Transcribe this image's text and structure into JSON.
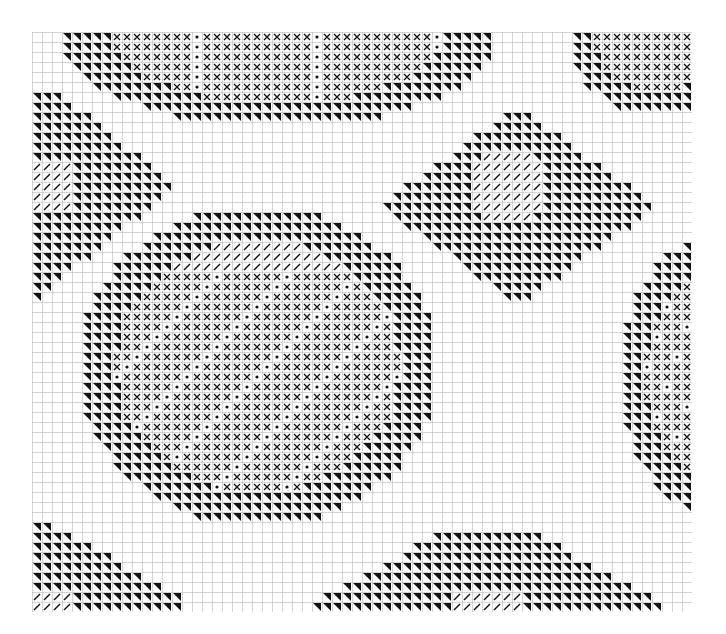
{
  "chart": {
    "cell_px": 10,
    "cols": 66,
    "rows": 58,
    "grid_color": "#b8b8b8",
    "ink_color": "#111111",
    "symbols": {
      "tri": "half-black triangle",
      "x": "cross",
      "dot": "ring dot",
      "slash": "diagonal slash",
      "dash": "horizontal dash"
    }
  }
}
